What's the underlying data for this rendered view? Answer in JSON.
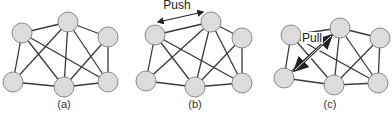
{
  "figure": {
    "panels": [
      {
        "id": "a",
        "caption": "(a)",
        "caption_pos": [
          64,
          108
        ],
        "nodes": [
          [
            22,
            33
          ],
          [
            68,
            22
          ],
          [
            108,
            37
          ],
          [
            13,
            82
          ],
          [
            64,
            87
          ],
          [
            108,
            82
          ]
        ],
        "edges": [
          [
            0,
            1
          ],
          [
            1,
            2
          ],
          [
            0,
            3
          ],
          [
            3,
            4
          ],
          [
            4,
            5
          ],
          [
            2,
            5
          ],
          [
            0,
            4
          ],
          [
            0,
            5
          ],
          [
            1,
            3
          ],
          [
            1,
            4
          ],
          [
            1,
            5
          ],
          [
            2,
            4
          ]
        ],
        "annotation": null
      },
      {
        "id": "b",
        "caption": "(b)",
        "caption_pos": [
          195,
          108
        ],
        "nodes": [
          [
            155,
            35
          ],
          [
            211,
            22
          ],
          [
            242,
            38
          ],
          [
            146,
            81
          ],
          [
            195,
            87
          ],
          [
            242,
            83
          ]
        ],
        "edges": [
          [
            0,
            1
          ],
          [
            1,
            2
          ],
          [
            0,
            3
          ],
          [
            3,
            4
          ],
          [
            4,
            5
          ],
          [
            2,
            5
          ],
          [
            0,
            4
          ],
          [
            0,
            5
          ],
          [
            1,
            3
          ],
          [
            1,
            4
          ],
          [
            1,
            5
          ],
          [
            2,
            4
          ]
        ],
        "annotation": {
          "label": "Push",
          "label_pos": [
            177,
            9
          ],
          "arrow_from": [
            158,
            22
          ],
          "arrow_to": [
            203,
            12
          ],
          "double_line": false
        }
      },
      {
        "id": "c",
        "caption": "(c)",
        "caption_pos": [
          330,
          108
        ],
        "nodes": [
          [
            291,
            35
          ],
          [
            340,
            28
          ],
          [
            380,
            38
          ],
          [
            284,
            78
          ],
          [
            334,
            85
          ],
          [
            378,
            83
          ]
        ],
        "edges": [
          [
            0,
            1
          ],
          [
            1,
            2
          ],
          [
            0,
            3
          ],
          [
            3,
            4
          ],
          [
            4,
            5
          ],
          [
            2,
            5
          ],
          [
            0,
            4
          ],
          [
            0,
            5
          ],
          [
            1,
            3
          ],
          [
            1,
            4
          ],
          [
            1,
            5
          ],
          [
            2,
            4
          ]
        ],
        "annotation": {
          "label": "Pull",
          "label_pos": [
            312,
            42
          ],
          "arrow_from": [
            295,
            70
          ],
          "arrow_to": [
            331,
            36
          ],
          "double_line": true
        }
      }
    ],
    "node_radius": 10,
    "colors": {
      "node_fill": "#dcdcdc",
      "node_stroke": "#8a8a8a",
      "edge": "#3a3a3a",
      "text": "#333333"
    }
  }
}
